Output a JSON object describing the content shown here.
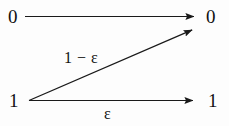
{
  "diagram": {
    "kind": "z-channel-transition-diagram",
    "background_color": "#fdfdfd",
    "stroke_color": "#1a1a1a",
    "inputs": [
      {
        "id": "input-0",
        "label": "0"
      },
      {
        "id": "input-1",
        "label": "1"
      }
    ],
    "outputs": [
      {
        "id": "output-0",
        "label": "0"
      },
      {
        "id": "output-1",
        "label": "1"
      }
    ],
    "edges": [
      {
        "id": "edge-0-to-0",
        "from": "input-0",
        "to": "output-0",
        "label": "",
        "x1": 25,
        "y1": 16.5,
        "x2": 201,
        "y2": 16.5
      },
      {
        "id": "edge-1-to-0",
        "from": "input-1",
        "to": "output-0",
        "label": "1 − ε",
        "x1": 29,
        "y1": 100.5,
        "x2": 199,
        "y2": 27
      },
      {
        "id": "edge-1-to-1",
        "from": "input-1",
        "to": "output-1",
        "label": "ε",
        "x1": 29,
        "y1": 100.5,
        "x2": 200,
        "y2": 100.5
      }
    ]
  }
}
